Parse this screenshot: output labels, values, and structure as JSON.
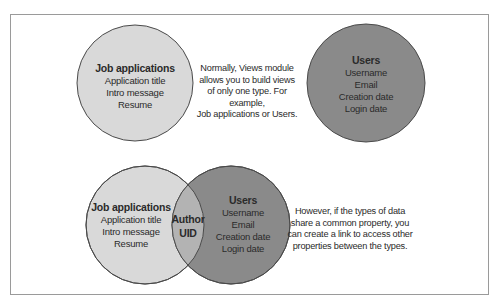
{
  "top_diagram": {
    "left_circle": {
      "title": "Job applications",
      "fields": [
        "Application title",
        "Intro message",
        "Resume"
      ],
      "fill": "#d9d9d9"
    },
    "right_circle": {
      "title": "Users",
      "fields": [
        "Username",
        "Email",
        "Creation date",
        "Login date"
      ],
      "fill": "#8a8a8a"
    },
    "note": [
      "Normally, Views module",
      "allows you to build views",
      "of only one type. For example,",
      "Job applications or Users."
    ]
  },
  "bottom_diagram": {
    "left_circle": {
      "title": "Job applications",
      "fields": [
        "Application title",
        "Intro message",
        "Resume"
      ],
      "fill": "#d9d9d9"
    },
    "overlap": {
      "lines": [
        "Author",
        "UID"
      ],
      "fill": "#b3b3b3"
    },
    "right_circle": {
      "title": "Users",
      "fields": [
        "Username",
        "Email",
        "Creation date",
        "Login date"
      ],
      "fill": "#8a8a8a"
    },
    "note": [
      "However, if the types of data",
      "share a common property, you",
      "can create a link to access other",
      "properties between the types."
    ]
  },
  "colors": {
    "stroke": "#4a4a4a",
    "frame_border": "#9a9a9a",
    "text": "#2a2a2a"
  }
}
